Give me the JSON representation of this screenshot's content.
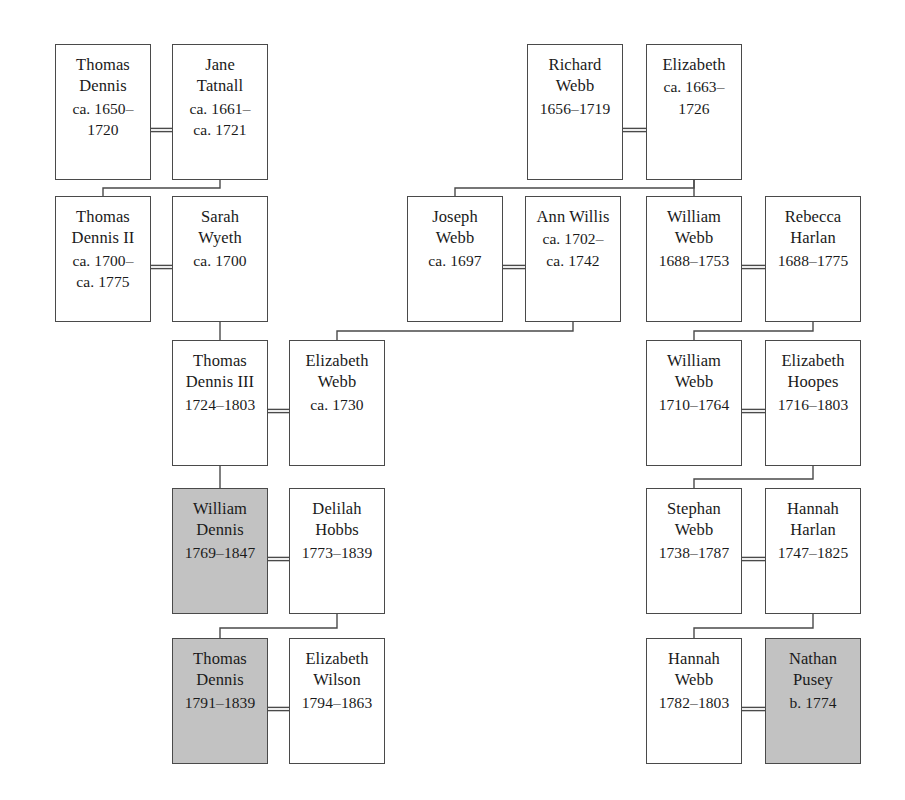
{
  "diagram": {
    "type": "genealogical-family-tree",
    "canvas": {
      "width": 905,
      "height": 800
    },
    "colors": {
      "background": "#ffffff",
      "box_border": "#4a4a4a",
      "box_fill": "#ffffff",
      "highlight_fill": "#c2c2c2",
      "line": "#4a4a4a",
      "text": "#1a1a1a"
    },
    "persons": [
      {
        "id": "thomas-dennis",
        "name_lines": [
          "Thomas",
          "Dennis"
        ],
        "dates": [
          "ca. 1650–",
          "1720"
        ],
        "shaded": false,
        "x": 55,
        "y": 44,
        "w": 96,
        "h": 136
      },
      {
        "id": "jane-tatnall",
        "name_lines": [
          "Jane",
          "Tatnall"
        ],
        "dates": [
          "ca. 1661–",
          "ca. 1721"
        ],
        "shaded": false,
        "x": 172,
        "y": 44,
        "w": 96,
        "h": 136
      },
      {
        "id": "richard-webb",
        "name_lines": [
          "Richard",
          "Webb"
        ],
        "dates": [
          "1656–1719"
        ],
        "shaded": false,
        "x": 527,
        "y": 44,
        "w": 96,
        "h": 136
      },
      {
        "id": "elizabeth",
        "name_lines": [
          "Elizabeth"
        ],
        "dates": [
          "ca. 1663–",
          "1726"
        ],
        "shaded": false,
        "x": 646,
        "y": 44,
        "w": 96,
        "h": 136
      },
      {
        "id": "thomas-dennis-ii",
        "name_lines": [
          "Thomas",
          "Dennis II"
        ],
        "dates": [
          "ca. 1700–",
          "ca. 1775"
        ],
        "shaded": false,
        "x": 55,
        "y": 196,
        "w": 96,
        "h": 126
      },
      {
        "id": "sarah-wyeth",
        "name_lines": [
          "Sarah",
          "Wyeth"
        ],
        "dates": [
          "ca. 1700"
        ],
        "shaded": false,
        "x": 172,
        "y": 196,
        "w": 96,
        "h": 126
      },
      {
        "id": "joseph-webb",
        "name_lines": [
          "Joseph",
          "Webb"
        ],
        "dates": [
          "ca. 1697"
        ],
        "shaded": false,
        "x": 407,
        "y": 196,
        "w": 96,
        "h": 126
      },
      {
        "id": "ann-willis",
        "name_lines": [
          "Ann Willis"
        ],
        "dates": [
          "ca. 1702–",
          "ca. 1742"
        ],
        "shaded": false,
        "x": 525,
        "y": 196,
        "w": 96,
        "h": 126
      },
      {
        "id": "william-webb-1688",
        "name_lines": [
          "William",
          "Webb"
        ],
        "dates": [
          "1688–1753"
        ],
        "shaded": false,
        "x": 646,
        "y": 196,
        "w": 96,
        "h": 126
      },
      {
        "id": "rebecca-harlan",
        "name_lines": [
          "Rebecca",
          "Harlan"
        ],
        "dates": [
          "1688–1775"
        ],
        "shaded": false,
        "x": 765,
        "y": 196,
        "w": 96,
        "h": 126
      },
      {
        "id": "thomas-dennis-iii",
        "name_lines": [
          "Thomas",
          "Dennis III"
        ],
        "dates": [
          "1724–1803"
        ],
        "shaded": false,
        "x": 172,
        "y": 340,
        "w": 96,
        "h": 126
      },
      {
        "id": "elizabeth-webb",
        "name_lines": [
          "Elizabeth",
          "Webb"
        ],
        "dates": [
          "ca. 1730"
        ],
        "shaded": false,
        "x": 289,
        "y": 340,
        "w": 96,
        "h": 126
      },
      {
        "id": "william-webb-1710",
        "name_lines": [
          "William",
          "Webb"
        ],
        "dates": [
          "1710–1764"
        ],
        "shaded": false,
        "x": 646,
        "y": 340,
        "w": 96,
        "h": 126
      },
      {
        "id": "elizabeth-hoopes",
        "name_lines": [
          "Elizabeth",
          "Hoopes"
        ],
        "dates": [
          "1716–1803"
        ],
        "shaded": false,
        "x": 765,
        "y": 340,
        "w": 96,
        "h": 126
      },
      {
        "id": "william-dennis",
        "name_lines": [
          "William",
          "Dennis"
        ],
        "dates": [
          "1769–1847"
        ],
        "shaded": true,
        "x": 172,
        "y": 488,
        "w": 96,
        "h": 126
      },
      {
        "id": "delilah-hobbs",
        "name_lines": [
          "Delilah",
          "Hobbs"
        ],
        "dates": [
          "1773–1839"
        ],
        "shaded": false,
        "x": 289,
        "y": 488,
        "w": 96,
        "h": 126
      },
      {
        "id": "stephan-webb",
        "name_lines": [
          "Stephan",
          "Webb"
        ],
        "dates": [
          "1738–1787"
        ],
        "shaded": false,
        "x": 646,
        "y": 488,
        "w": 96,
        "h": 126
      },
      {
        "id": "hannah-harlan",
        "name_lines": [
          "Hannah",
          "Harlan"
        ],
        "dates": [
          "1747–1825"
        ],
        "shaded": false,
        "x": 765,
        "y": 488,
        "w": 96,
        "h": 126
      },
      {
        "id": "thomas-dennis-1791",
        "name_lines": [
          "Thomas",
          "Dennis"
        ],
        "dates": [
          "1791–1839"
        ],
        "shaded": true,
        "x": 172,
        "y": 638,
        "w": 96,
        "h": 126
      },
      {
        "id": "elizabeth-wilson",
        "name_lines": [
          "Elizabeth",
          "Wilson"
        ],
        "dates": [
          "1794–1863"
        ],
        "shaded": false,
        "x": 289,
        "y": 638,
        "w": 96,
        "h": 126
      },
      {
        "id": "hannah-webb",
        "name_lines": [
          "Hannah",
          "Webb"
        ],
        "dates": [
          "1782–1803"
        ],
        "shaded": false,
        "x": 646,
        "y": 638,
        "w": 96,
        "h": 126
      },
      {
        "id": "nathan-pusey",
        "name_lines": [
          "Nathan",
          "Pusey"
        ],
        "dates": [
          "b. 1774"
        ],
        "shaded": true,
        "x": 765,
        "y": 638,
        "w": 96,
        "h": 126
      }
    ],
    "marriage_links": [
      {
        "id": "m-thomas-jane",
        "x1": 151,
        "x2": 172,
        "y": 130
      },
      {
        "id": "m-richard-elizabeth",
        "x1": 623,
        "x2": 646,
        "y": 130
      },
      {
        "id": "m-thomasii-sarah",
        "x1": 151,
        "x2": 172,
        "y": 267
      },
      {
        "id": "m-joseph-ann",
        "x1": 503,
        "x2": 525,
        "y": 267
      },
      {
        "id": "m-williamwebb-rebecca",
        "x1": 742,
        "x2": 765,
        "y": 267
      },
      {
        "id": "m-thomasiii-elizabethwebb",
        "x1": 268,
        "x2": 289,
        "y": 411
      },
      {
        "id": "m-williamwebb1710-hoopes",
        "x1": 742,
        "x2": 765,
        "y": 411
      },
      {
        "id": "m-williamdennis-delilah",
        "x1": 268,
        "x2": 289,
        "y": 559
      },
      {
        "id": "m-stephan-hannahharlan",
        "x1": 742,
        "x2": 765,
        "y": 559
      },
      {
        "id": "m-thomas1791-elizabethwilson",
        "x1": 268,
        "x2": 289,
        "y": 709
      },
      {
        "id": "m-hannahwebb-nathan",
        "x1": 742,
        "x2": 765,
        "y": 709
      }
    ],
    "descent_links": [
      {
        "id": "d-jane-to-thomasii",
        "path": "M 220 180 L 220 188 L 103 188 L 103 196"
      },
      {
        "id": "d-sarah-to-thomasiii",
        "path": "M 220 322 L 220 340"
      },
      {
        "id": "d-elizabeth-to-josephwebb",
        "path": "M 694 180 L 694 188 L 455 188 L 455 196"
      },
      {
        "id": "d-elizabeth-to-williamwebb",
        "path": "M 694 180 L 694 188 L 694 196"
      },
      {
        "id": "d-annwillis-to-elizabethwebb",
        "path": "M 573 322 L 573 331 L 337 331 L 337 340"
      },
      {
        "id": "d-rebecca-to-williamwebb1710",
        "path": "M 813 322 L 813 331 L 694 331 L 694 340"
      },
      {
        "id": "d-thomasiii-to-williamdennis",
        "path": "M 220 466 L 220 488"
      },
      {
        "id": "d-hoopes-to-stephan",
        "path": "M 813 466 L 813 479 L 694 479 L 694 488"
      },
      {
        "id": "d-delilah-to-thomas1791",
        "path": "M 337 614 L 337 628 L 220 628 L 220 638"
      },
      {
        "id": "d-hannahharlan-to-hannahwebb",
        "path": "M 813 614 L 813 628 L 694 628 L 694 638"
      }
    ]
  }
}
